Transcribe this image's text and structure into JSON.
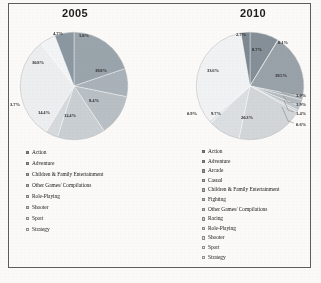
{
  "figure": {
    "border_color": "#5d5d5d",
    "background": "#fbfaf8"
  },
  "charts": [
    {
      "id": "2005",
      "title": "2005"
    },
    {
      "id": "2010",
      "title": "2010"
    }
  ],
  "legend_2005": {
    "items": [
      {
        "label": "Action",
        "color": "#7e8a93"
      },
      {
        "label": "Adventure",
        "color": "#8f9aa2"
      },
      {
        "label": "Children & Family Entertainment",
        "color": "#9fa9b0"
      },
      {
        "label": "Other Games/ Compilations",
        "color": "#b3bbc1"
      },
      {
        "label": "Role-Playing",
        "color": "#c3c9ce"
      },
      {
        "label": "Shooter",
        "color": "#d3d8db"
      },
      {
        "label": "Sport",
        "color": "#e2e5e7"
      },
      {
        "label": "Strategy",
        "color": "#eff1f2"
      }
    ]
  },
  "legend_2010": {
    "items": [
      {
        "label": "Action",
        "color": "#78848d"
      },
      {
        "label": "Adventure",
        "color": "#868f96"
      },
      {
        "label": "Arcade",
        "color": "#939ba1"
      },
      {
        "label": "Casual",
        "color": "#a0a8ae"
      },
      {
        "label": "Children & Family Entertainment",
        "color": "#adb4b9"
      },
      {
        "label": "Fighting",
        "color": "#b9bfc4"
      },
      {
        "label": "Other Games/ Compilations",
        "color": "#c4c9cd"
      },
      {
        "label": "Racing",
        "color": "#cfd3d7"
      },
      {
        "label": "Role-Playing",
        "color": "#dadee0"
      },
      {
        "label": "Shooter",
        "color": "#e4e7e9"
      },
      {
        "label": "Sport",
        "color": "#eef0f1"
      },
      {
        "label": "Strategy",
        "color": "#f6f7f7"
      }
    ]
  },
  "chart_data": [
    {
      "type": "pie",
      "title": "2005",
      "legend_position": "below",
      "labels": [
        "Action",
        "Adventure",
        "Children & Family Entertainment",
        "Other Games/ Compilations",
        "Role-Playing",
        "Shooter",
        "Sport",
        "Strategy"
      ],
      "values": [
        19.8,
        8.4,
        12.4,
        14.4,
        3.7,
        30.8,
        4.7,
        5.8
      ],
      "value_labels": [
        "19.8%",
        "8.4%",
        "12.4%",
        "14.4%",
        "3.7%",
        "30.8%",
        "4.7%",
        "5.8%"
      ],
      "colors": [
        "#9aa4ac",
        "#aab2b9",
        "#b9c0c5",
        "#c9cfd3",
        "#d6dadd",
        "#eceeef",
        "#f3f4f5",
        "#8c98a1"
      ],
      "units": "percent"
    },
    {
      "type": "pie",
      "title": "2010",
      "legend_position": "below",
      "labels": [
        "Action",
        "Adventure",
        "Arcade",
        "Casual",
        "Children & Family Entertainment",
        "Fighting",
        "Other Games/ Compilations",
        "Racing",
        "Role-Playing",
        "Shooter",
        "Sport",
        "Strategy"
      ],
      "values": [
        8.7,
        0.1,
        19.5,
        1.0,
        1.9,
        1.4,
        0.6,
        20.3,
        9.7,
        0.9,
        33.6,
        2.7
      ],
      "value_labels": [
        "8.7%",
        "0.1%",
        "19.5%",
        "1.0%",
        "1.9%",
        "1.4%",
        "0.6%",
        "20.3%",
        "9.7%",
        "0.9%",
        "33.6%",
        "2.7%"
      ],
      "colors": [
        "#848f97",
        "#8e979e",
        "#9aa2a9",
        "#a8afb5",
        "#b4bbc0",
        "#bfc5c9",
        "#c9ced2",
        "#d2d6d9",
        "#dbdfe1",
        "#e4e7e9",
        "#f1f2f3",
        "#7d8891"
      ],
      "units": "percent"
    }
  ],
  "labels_2005": [
    {
      "text": "4.7%",
      "x": 58,
      "y": 33
    },
    {
      "text": "5.8%",
      "x": 84,
      "y": 35
    },
    {
      "text": "19.8%",
      "x": 101,
      "y": 70
    },
    {
      "text": "8.4%",
      "x": 94,
      "y": 100
    },
    {
      "text": "12.4%",
      "x": 70,
      "y": 115
    },
    {
      "text": "14.4%",
      "x": 44,
      "y": 112
    },
    {
      "text": "3.7%",
      "x": 15,
      "y": 104
    },
    {
      "text": "30.8%",
      "x": 38,
      "y": 62
    }
  ],
  "labels_2010": [
    {
      "text": "2.7%",
      "x": 241,
      "y": 34
    },
    {
      "text": "8.7%",
      "x": 257,
      "y": 49
    },
    {
      "text": "0.1%",
      "x": 283,
      "y": 42
    },
    {
      "text": "19.5%",
      "x": 281,
      "y": 75
    },
    {
      "text": "20.3%",
      "x": 247,
      "y": 117
    },
    {
      "text": "9.7%",
      "x": 216,
      "y": 113
    },
    {
      "text": "0.9%",
      "x": 192,
      "y": 113
    },
    {
      "text": "33.6%",
      "x": 213,
      "y": 70
    }
  ],
  "callouts_2010": [
    {
      "text": "1.0%",
      "x": 296,
      "y": 95
    },
    {
      "text": "1.9%",
      "x": 296,
      "y": 104
    },
    {
      "text": "1.4%",
      "x": 296,
      "y": 113
    },
    {
      "text": "0.6%",
      "x": 296,
      "y": 124
    }
  ]
}
